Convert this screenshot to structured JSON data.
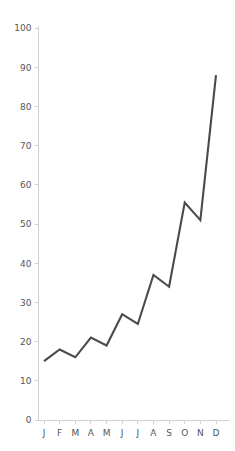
{
  "chart_data": {
    "type": "line",
    "title": "",
    "subtitle": "",
    "xlabel": "",
    "ylabel": "",
    "categories": [
      "J",
      "F",
      "M",
      "A",
      "M",
      "J",
      "J",
      "A",
      "S",
      "O",
      "N",
      "D"
    ],
    "series": [
      {
        "name": "series-1",
        "values": [
          15,
          18,
          16,
          21,
          19,
          27,
          24.5,
          37,
          34,
          55.5,
          51,
          88
        ],
        "color": "#4a4a4a"
      }
    ],
    "values": [
      15,
      18,
      16,
      21,
      19,
      27,
      24.5,
      37,
      34,
      55.5,
      51,
      88
    ],
    "ylim": [
      0,
      100
    ],
    "y_ticks": [
      0,
      10,
      20,
      30,
      40,
      50,
      60,
      70,
      80,
      90,
      100
    ],
    "y_tick_labels": [
      "0",
      "10",
      "20",
      "30",
      "40",
      "50",
      "60",
      "70",
      "80",
      "90",
      "100"
    ],
    "x_tick_labels": [
      "J",
      "F",
      "M",
      "A",
      "M",
      "J",
      "J",
      "A",
      "S",
      "O",
      "N",
      "D"
    ],
    "grid": false,
    "legend": false,
    "legend_position": "none",
    "annotations": [],
    "colors": {
      "line": "#4a4a4a",
      "axis": "#d2d2d2",
      "tick_text": "#555555",
      "background": "#ffffff"
    }
  }
}
